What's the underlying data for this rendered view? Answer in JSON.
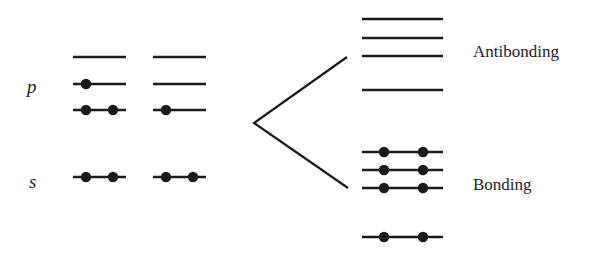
{
  "labels": {
    "p": "p",
    "s": "s",
    "antibonding": "Antibonding",
    "bonding": "Bonding"
  },
  "colors": {
    "line": "#1a1a1a",
    "electron": "#1a1a1a",
    "text": "#222222"
  },
  "atomic_levels": {
    "columns": [
      {
        "x1": 73,
        "x2": 126,
        "levels": [
          {
            "name": "p-upper",
            "y": 57,
            "electrons": []
          },
          {
            "name": "p-middle",
            "y": 84,
            "electrons": [
              86
            ]
          },
          {
            "name": "p-lower",
            "y": 110,
            "electrons": [
              86,
              113
            ]
          },
          {
            "name": "s",
            "y": 177,
            "electrons": [
              86,
              113
            ]
          }
        ]
      },
      {
        "x1": 153,
        "x2": 206,
        "levels": [
          {
            "name": "p-upper",
            "y": 57,
            "electrons": []
          },
          {
            "name": "p-middle",
            "y": 84,
            "electrons": []
          },
          {
            "name": "p-lower",
            "y": 110,
            "electrons": [
              166
            ]
          },
          {
            "name": "s",
            "y": 177,
            "electrons": [
              166,
              193
            ]
          }
        ]
      }
    ]
  },
  "molecular_levels": {
    "x1": 362,
    "x2": 443,
    "antibonding": [
      {
        "y": 19,
        "electrons": []
      },
      {
        "y": 38,
        "electrons": []
      },
      {
        "y": 56,
        "electrons": []
      },
      {
        "y": 90,
        "electrons": []
      }
    ],
    "bonding": [
      {
        "y": 152,
        "electrons": [
          384,
          423
        ]
      },
      {
        "y": 170,
        "electrons": [
          384,
          423
        ]
      },
      {
        "y": 188,
        "electrons": [
          384,
          423
        ]
      },
      {
        "y": 237,
        "electrons": [
          384,
          423
        ]
      }
    ]
  },
  "wedge": {
    "vertex": [
      254,
      123
    ],
    "upper": [
      347,
      57
    ],
    "lower": [
      348,
      188
    ]
  }
}
